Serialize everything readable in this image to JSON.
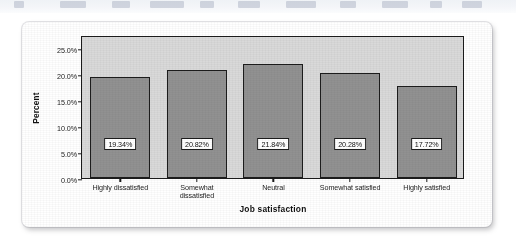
{
  "page": {
    "background_color": "#ffffff",
    "ghost_strip": {
      "description": "faded clipped remnant of scanned page text above the figure",
      "color": "#9aa4b8"
    }
  },
  "chart_data": {
    "type": "bar",
    "title": "",
    "xlabel": "Job satisfaction",
    "ylabel": "Percent",
    "categories": [
      "Highly dissatisfied",
      "Somewhat\ndissatisfied",
      "Neutral",
      "Somewhat satisfied",
      "Highly satisfied"
    ],
    "values": [
      19.34,
      20.82,
      21.84,
      20.28,
      17.72
    ],
    "data_labels": [
      "19.34%",
      "20.82%",
      "21.84%",
      "20.28%",
      "17.72%"
    ],
    "ylim": [
      0,
      27.5
    ],
    "yticks": [
      0,
      5,
      10,
      15,
      20,
      25
    ],
    "ytick_labels": [
      "0.0%",
      "5.0%",
      "10.0%",
      "15.0%",
      "20.0%",
      "25.0%"
    ],
    "grid": false,
    "legend": null,
    "bar_color": "#919191",
    "bar_edge_color": "#1c1c1c",
    "plot_background_color": "#d9d9d9"
  }
}
